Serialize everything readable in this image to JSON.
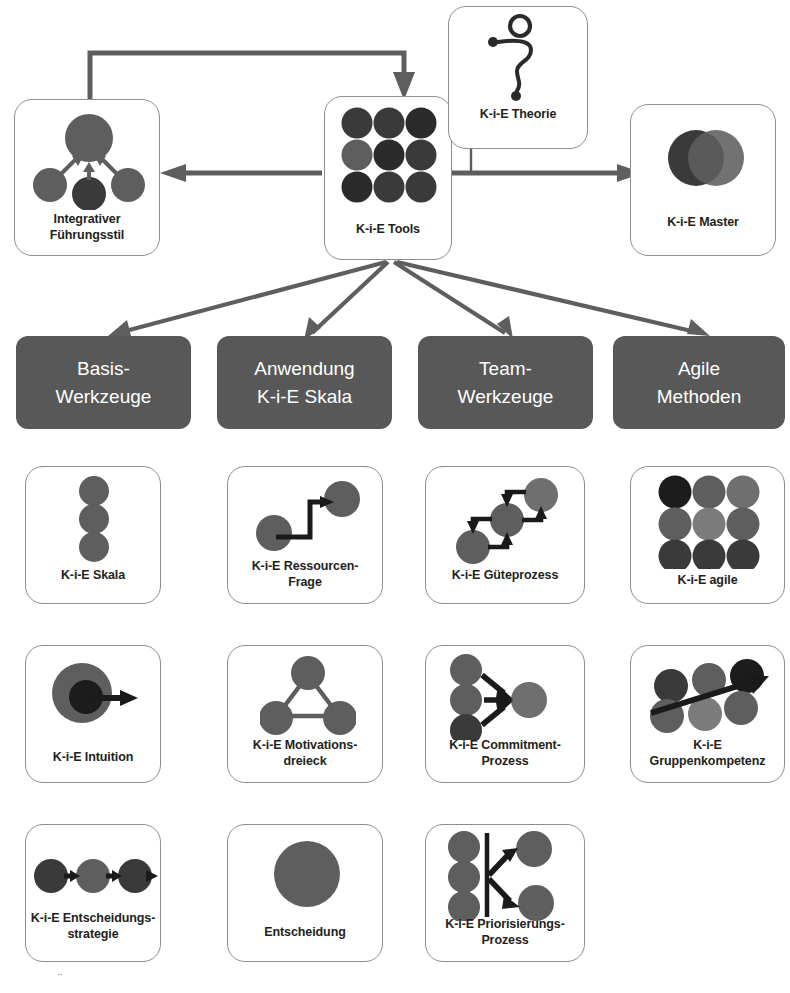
{
  "diagram": {
    "colors": {
      "category_box_fill": "#585858",
      "category_box_text": "#ffffff",
      "card_border": "#8d8d8d",
      "card_fill": "#ffffff",
      "circle_grey": "#5e5e5e",
      "circle_dark": "#3a3a3a",
      "circle_black": "#1c1c1c",
      "circle_light": "#7b7b7b",
      "arrow_dark": "#1a1a1a",
      "connector_grey": "#5e5e5e",
      "text": "#231f20"
    }
  },
  "top_row": {
    "left_card": {
      "label": "Integrativer\nFührungsstil",
      "label_line1": "Integrativer",
      "label_line2": "Führungsstil",
      "icon": "four-circles-converging-icon"
    },
    "center_card": {
      "label": "K-i-E Tools",
      "icon": "three-by-three-circle-grid-icon"
    },
    "theory_card": {
      "label": "K-i-E Theorie",
      "icon": "question-mark-squiggle-icon"
    },
    "right_card": {
      "label": "K-i-E Master",
      "icon": "two-overlapping-circles-icon"
    }
  },
  "categories": [
    {
      "line1": "Basis-",
      "line2": "Werkzeuge"
    },
    {
      "line1": "Anwendung",
      "line2": "K-i-E Skala"
    },
    {
      "line1": "Team-",
      "line2": "Werkzeuge"
    },
    {
      "line1": "Agile",
      "line2": "Methoden"
    }
  ],
  "tools": [
    {
      "label_line1": "K-i-E Skala",
      "label_line2": "",
      "icon": "three-stacked-circles-icon",
      "column": 1,
      "row": 1
    },
    {
      "label_line1": "K-i-E Ressourcen-",
      "label_line2": "Frage",
      "icon": "step-up-arrow-two-circles-icon",
      "column": 2,
      "row": 1
    },
    {
      "label_line1": "K-i-E Güteprozess",
      "label_line2": "",
      "icon": "diagonal-three-circles-loop-icon",
      "column": 3,
      "row": 1
    },
    {
      "label_line1": "K-i-E agile",
      "label_line2": "",
      "icon": "nine-circle-grid-icon",
      "column": 4,
      "row": 1
    },
    {
      "label_line1": "K-i-E Intuition",
      "label_line2": "",
      "icon": "circle-in-circle-arrow-icon",
      "column": 1,
      "row": 2
    },
    {
      "label_line1": "K-i-E Motivations-",
      "label_line2": "dreieck",
      "icon": "triangle-three-circles-icon",
      "column": 2,
      "row": 2
    },
    {
      "label_line1": "K-i-E Commitment-",
      "label_line2": "Prozess",
      "icon": "three-to-one-arrows-icon",
      "column": 3,
      "row": 2
    },
    {
      "label_line1": "K-i-E",
      "label_line2": "Gruppenkompetenz",
      "icon": "six-circles-rising-arrow-icon",
      "column": 4,
      "row": 2
    },
    {
      "label_line1": "K-i-E Entscheidungs-",
      "label_line2": "strategie",
      "icon": "three-circles-chain-arrow-icon",
      "column": 1,
      "row": 3
    },
    {
      "label_line1": "Entscheidung",
      "label_line2": "",
      "icon": "single-large-circle-icon",
      "column": 2,
      "row": 3
    },
    {
      "label_line1": "K-i-E Priorisierungs-",
      "label_line2": "Prozess",
      "icon": "split-bar-two-arrows-icon",
      "column": 3,
      "row": 3
    }
  ],
  "connections": [
    {
      "from": "K-i-E Tools",
      "to": "Integrativer Führungsstil",
      "style": "arrow-left"
    },
    {
      "from": "K-i-E Tools",
      "to": "K-i-E Master",
      "style": "arrow-right"
    },
    {
      "from": "Integrativer Führungsstil",
      "to": "K-i-E Tools",
      "style": "arrow-loop-top-down"
    },
    {
      "from": "K-i-E Theorie",
      "to": "K-i-E Master",
      "style": "line-down"
    },
    {
      "from": "K-i-E Tools",
      "to": "Basis-Werkzeuge",
      "style": "arrow-fan"
    },
    {
      "from": "K-i-E Tools",
      "to": "Anwendung K-i-E Skala",
      "style": "arrow-fan"
    },
    {
      "from": "K-i-E Tools",
      "to": "Team-Werkzeuge",
      "style": "arrow-fan"
    },
    {
      "from": "K-i-E Tools",
      "to": "Agile Methoden",
      "style": "arrow-fan"
    }
  ],
  "artifact": {
    "text": "¨"
  }
}
